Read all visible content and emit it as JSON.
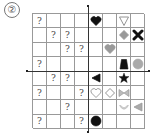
{
  "label": "②",
  "grid": {
    "rows": 8,
    "cols": 8,
    "cells": [
      {
        "row": 0,
        "col": 0,
        "type": "text",
        "value": "?"
      },
      {
        "row": 0,
        "col": 4,
        "type": "shape",
        "shape": "heart",
        "fill": "#111111",
        "stroke": "#111111"
      },
      {
        "row": 0,
        "col": 6,
        "type": "shape",
        "shape": "triangle-down",
        "fill": "#ffffff",
        "stroke": "#888888"
      },
      {
        "row": 1,
        "col": 1,
        "type": "text",
        "value": "?"
      },
      {
        "row": 1,
        "col": 2,
        "type": "text",
        "value": "?"
      },
      {
        "row": 1,
        "col": 6,
        "type": "shape",
        "shape": "diamond",
        "fill": "#999999",
        "stroke": "#999999"
      },
      {
        "row": 1,
        "col": 7,
        "type": "shape",
        "shape": "x-cross",
        "fill": "#111111",
        "stroke": "#111111"
      },
      {
        "row": 2,
        "col": 2,
        "type": "text",
        "value": "?"
      },
      {
        "row": 2,
        "col": 3,
        "type": "text",
        "value": "?"
      },
      {
        "row": 2,
        "col": 5,
        "type": "shape",
        "shape": "heart",
        "fill": "#999999",
        "stroke": "#999999"
      },
      {
        "row": 3,
        "col": 0,
        "type": "text",
        "value": "?"
      },
      {
        "row": 3,
        "col": 6,
        "type": "shape",
        "shape": "trapezoid",
        "fill": "#111111",
        "stroke": "#111111"
      },
      {
        "row": 3,
        "col": 7,
        "type": "shape",
        "shape": "circle",
        "fill": "#aaaaaa",
        "stroke": "#aaaaaa"
      },
      {
        "row": 4,
        "col": 1,
        "type": "text",
        "value": "?"
      },
      {
        "row": 4,
        "col": 2,
        "type": "text",
        "value": "?"
      },
      {
        "row": 4,
        "col": 4,
        "type": "shape",
        "shape": "triangle-left",
        "fill": "#111111",
        "stroke": "#111111"
      },
      {
        "row": 4,
        "col": 6,
        "type": "shape",
        "shape": "star",
        "fill": "#111111",
        "stroke": "#111111"
      },
      {
        "row": 5,
        "col": 0,
        "type": "text",
        "value": "?"
      },
      {
        "row": 5,
        "col": 3,
        "type": "text",
        "value": "?"
      },
      {
        "row": 5,
        "col": 4,
        "type": "shape",
        "shape": "heart",
        "fill": "#ffffff",
        "stroke": "#888888"
      },
      {
        "row": 5,
        "col": 5,
        "type": "shape",
        "shape": "diamond",
        "fill": "#ffffff",
        "stroke": "#888888"
      },
      {
        "row": 5,
        "col": 6,
        "type": "shape",
        "shape": "bowtie",
        "fill": "#bbbbbb",
        "stroke": "#999999"
      },
      {
        "row": 6,
        "col": 2,
        "type": "text",
        "value": "?"
      },
      {
        "row": 6,
        "col": 6,
        "type": "shape",
        "shape": "smile-arc",
        "fill": "#cccccc",
        "stroke": "#bbbbbb"
      },
      {
        "row": 6,
        "col": 7,
        "type": "shape",
        "shape": "triangle-left",
        "fill": "#aaaaaa",
        "stroke": "#999999"
      },
      {
        "row": 7,
        "col": 0,
        "type": "text",
        "value": "?"
      },
      {
        "row": 7,
        "col": 3,
        "type": "text",
        "value": "?"
      },
      {
        "row": 7,
        "col": 4,
        "type": "shape",
        "shape": "circle",
        "fill": "#111111",
        "stroke": "#111111"
      }
    ]
  },
  "axes": {
    "vertical_col_boundary": 4,
    "horizontal_row_boundary": 4
  }
}
